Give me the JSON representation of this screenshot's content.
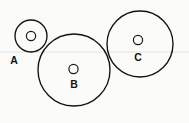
{
  "figure": {
    "background_color": "#fbfbfa",
    "stroke_color": "#111111",
    "guide_line_color": "#e2e2e0",
    "width": 189,
    "height": 123
  },
  "guide_line": {
    "name": "horizontal-rule",
    "y": 52,
    "x1": 0,
    "x2": 189
  },
  "circles": [
    {
      "label": "A",
      "cx": 31,
      "cy": 36,
      "r": 16,
      "dot_cx": 31,
      "dot_cy": 36,
      "dot_r": 4.6,
      "label_x": 14,
      "label_y": 64
    },
    {
      "label": "B",
      "cx": 74,
      "cy": 70,
      "r": 36,
      "dot_cx": 73.5,
      "dot_cy": 69,
      "dot_r": 4.6,
      "label_x": 74,
      "label_y": 88
    },
    {
      "label": "C",
      "cx": 140,
      "cy": 44,
      "r": 33,
      "dot_cx": 138,
      "dot_cy": 40,
      "dot_r": 4.6,
      "label_x": 138,
      "label_y": 61
    }
  ]
}
